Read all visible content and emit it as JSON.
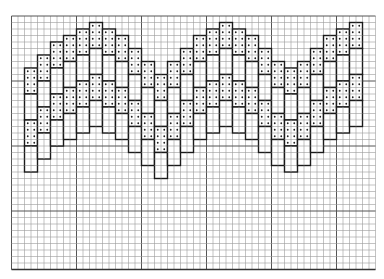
{
  "chart_data": {
    "type": "diagram",
    "title": "",
    "grid": {
      "origin_x": 11.5,
      "origin_y": 16,
      "cell": 6.5,
      "cols": 56,
      "rows": 39,
      "major_every": 10,
      "line_color": "#9a9a9a",
      "major_color": "#555555"
    },
    "block": {
      "width_cells": 2,
      "height_cells": 4
    },
    "strand_spacing_rows": 4,
    "strands": 4,
    "columns": [
      {
        "col": 2,
        "top": 8
      },
      {
        "col": 4,
        "top": 6
      },
      {
        "col": 6,
        "top": 4
      },
      {
        "col": 8,
        "top": 3
      },
      {
        "col": 10,
        "top": 2
      },
      {
        "col": 12,
        "top": 1
      },
      {
        "col": 14,
        "top": 2
      },
      {
        "col": 16,
        "top": 3
      },
      {
        "col": 18,
        "top": 5
      },
      {
        "col": 20,
        "top": 7
      },
      {
        "col": 22,
        "top": 9
      },
      {
        "col": 24,
        "top": 7
      },
      {
        "col": 26,
        "top": 5
      },
      {
        "col": 28,
        "top": 3
      },
      {
        "col": 30,
        "top": 2
      },
      {
        "col": 32,
        "top": 1
      },
      {
        "col": 34,
        "top": 2
      },
      {
        "col": 36,
        "top": 3
      },
      {
        "col": 38,
        "top": 5
      },
      {
        "col": 40,
        "top": 7
      },
      {
        "col": 42,
        "top": 8
      },
      {
        "col": 44,
        "top": 7
      },
      {
        "col": 46,
        "top": 5
      },
      {
        "col": 48,
        "top": 3
      },
      {
        "col": 50,
        "top": 2
      },
      {
        "col": 52,
        "top": 1
      }
    ],
    "colors": {
      "outline": "#1a1a1a",
      "dot": "#222222",
      "paper": "#ffffff"
    }
  }
}
